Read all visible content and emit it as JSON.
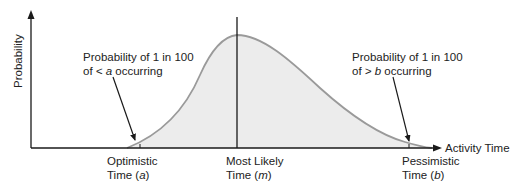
{
  "diagram": {
    "type": "beta-distribution",
    "y_axis_label": "Probability",
    "x_axis_label": "Activity Time",
    "annotations": {
      "left": {
        "line1": "Probability of 1 in 100",
        "line2_prefix": "of ",
        "line2_symbol": "< a",
        "line2_suffix": " occurring"
      },
      "right": {
        "line1": "Probability of 1 in 100",
        "line2_prefix": "of ",
        "line2_symbol": "> b",
        "line2_suffix": " occurring"
      }
    },
    "ticks": [
      {
        "line1": "Optimistic",
        "line2_prefix": "Time (",
        "var": "a",
        "line2_suffix": ")"
      },
      {
        "line1": "Most Likely",
        "line2_prefix": "Time (",
        "var": "m",
        "line2_suffix": ")"
      },
      {
        "line1": "Pessimistic",
        "line2_prefix": "Time (",
        "var": "b",
        "line2_suffix": ")"
      }
    ],
    "colors": {
      "axis": "#1a1a1a",
      "curve": "#9a9a9a",
      "fill": "#ececec",
      "text": "#222222"
    }
  }
}
